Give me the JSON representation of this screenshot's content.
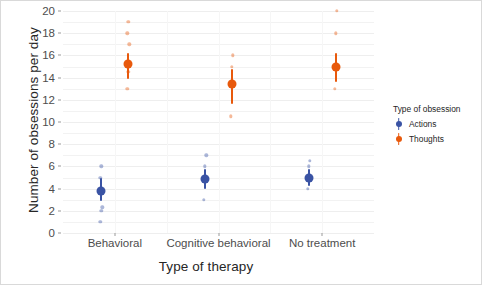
{
  "chart_data": {
    "type": "scatter",
    "title": "",
    "xlabel": "Type of therapy",
    "ylabel": "Number of obsessions per day",
    "categories": [
      "Behavioral",
      "Cognitive behavioral",
      "No treatment"
    ],
    "ylim": [
      0,
      20
    ],
    "yticks": [
      0,
      2,
      4,
      6,
      8,
      10,
      12,
      14,
      16,
      18,
      20
    ],
    "ytick_labels": [
      "0",
      "2",
      "4",
      "6",
      "8",
      "10",
      "12",
      "14",
      "16",
      "18",
      "20"
    ],
    "grid": true,
    "legend": {
      "title": "Type of obsession",
      "position": "right",
      "entries": [
        {
          "name": "Actions",
          "color": "#3a53a4"
        },
        {
          "name": "Thoughts",
          "color": "#e8590c"
        }
      ]
    },
    "series": [
      {
        "name": "Actions",
        "color": "#3a53a4",
        "points": [
          {
            "category": "Behavioral",
            "mean": 3.8,
            "ci_low": 2.9,
            "ci_high": 5.0,
            "raw": [
              1.0,
              2.0,
              2.3,
              5.0,
              6.0
            ]
          },
          {
            "category": "Cognitive behavioral",
            "mean": 4.9,
            "ci_low": 4.0,
            "ci_high": 5.8,
            "raw": [
              3.0,
              6.0,
              7.0
            ]
          },
          {
            "category": "No treatment",
            "mean": 5.0,
            "ci_low": 4.2,
            "ci_high": 5.8,
            "raw": [
              4.0,
              6.0,
              6.5
            ]
          }
        ]
      },
      {
        "name": "Thoughts",
        "color": "#e8590c",
        "points": [
          {
            "category": "Behavioral",
            "mean": 15.2,
            "ci_low": 13.9,
            "ci_high": 16.2,
            "raw": [
              13.0,
              14.5,
              17.0,
              18.0,
              19.0
            ]
          },
          {
            "category": "Cognitive behavioral",
            "mean": 13.4,
            "ci_low": 11.6,
            "ci_high": 14.8,
            "raw": [
              10.5,
              15.0,
              16.0
            ]
          },
          {
            "category": "No treatment",
            "mean": 15.0,
            "ci_low": 13.6,
            "ci_high": 16.2,
            "raw": [
              13.0,
              18.0,
              20.0
            ]
          }
        ]
      }
    ]
  }
}
